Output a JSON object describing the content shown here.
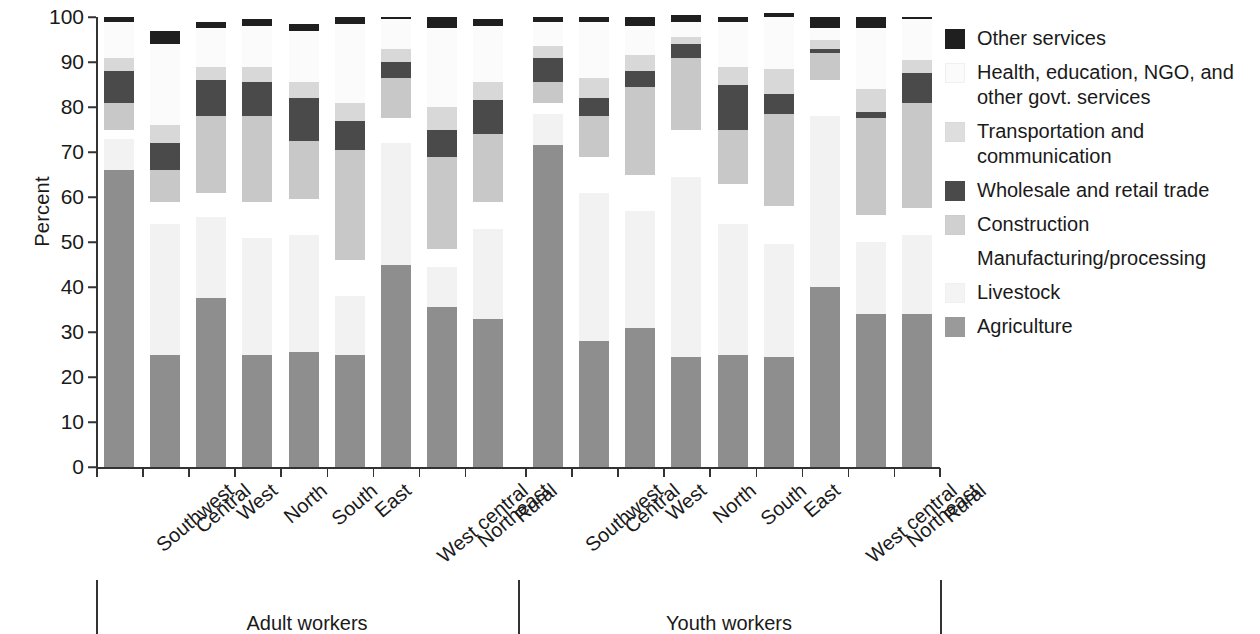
{
  "chart_data": {
    "type": "bar",
    "subtype": "stacked-bar",
    "title": "",
    "xlabel": "",
    "ylabel": "Percent",
    "ylim": [
      0,
      100
    ],
    "yticks": [
      0,
      10,
      20,
      30,
      40,
      50,
      60,
      70,
      80,
      90,
      100
    ],
    "grid": false,
    "legend_position": "right",
    "stack_order_bottom_to_top": [
      "Agriculture",
      "Livestock",
      "Manufacturing/processing",
      "Transportation and communication",
      "Wholesale and retail trade",
      "Construction",
      "Health, education, NGO, and other govt. services",
      "Other services"
    ],
    "groups": [
      {
        "name": "Adult workers",
        "categories": [
          "Southwest",
          "Central",
          "West",
          "North",
          "South",
          "East",
          "West central",
          "Northeast",
          "Rural"
        ]
      },
      {
        "name": "Youth workers",
        "categories": [
          "Southwest",
          "Central",
          "West",
          "North",
          "South",
          "East",
          "West central",
          "Northeast",
          "Rural"
        ]
      }
    ],
    "categories": [
      "Southwest",
      "Central",
      "West",
      "North",
      "South",
      "East",
      "West central",
      "Northeast",
      "Rural",
      "Southwest",
      "Central",
      "West",
      "North",
      "South",
      "East",
      "West central",
      "Northeast",
      "Rural"
    ],
    "series": [
      {
        "name": "Agriculture",
        "color": "#8e8e8e",
        "values": [
          66.0,
          25.0,
          37.5,
          25.0,
          25.5,
          25.0,
          45.0,
          35.5,
          33.0,
          71.5,
          28.0,
          31.0,
          24.5,
          25.0,
          24.5,
          40.0,
          34.0,
          34.0
        ]
      },
      {
        "name": "Livestock",
        "color": "#f2f2f2",
        "values": [
          7.0,
          29.0,
          18.0,
          26.0,
          26.0,
          13.0,
          27.0,
          9.0,
          20.0,
          7.0,
          33.0,
          26.0,
          40.0,
          29.0,
          25.0,
          38.0,
          16.0,
          17.5
        ]
      },
      {
        "name": "Manufacturing/processing",
        "color": "#ffffff",
        "values": [
          2.0,
          5.0,
          5.5,
          8.0,
          8.0,
          8.0,
          5.5,
          4.0,
          6.0,
          2.5,
          8.0,
          8.0,
          10.5,
          9.0,
          8.5,
          8.0,
          6.0,
          6.0
        ]
      },
      {
        "name": "Transportation and communication",
        "color": "#c8c8c8",
        "values": [
          6.0,
          7.0,
          17.0,
          19.0,
          13.0,
          24.5,
          9.0,
          20.5,
          15.0,
          4.5,
          9.0,
          19.5,
          16.0,
          12.0,
          20.5,
          6.0,
          21.5,
          23.5
        ]
      },
      {
        "name": "Wholesale and retail trade",
        "color": "#4a4a4a",
        "values": [
          7.0,
          6.0,
          8.0,
          7.5,
          9.5,
          6.5,
          3.5,
          6.0,
          7.5,
          5.5,
          4.0,
          3.5,
          3.0,
          10.0,
          4.5,
          1.0,
          1.5,
          6.5
        ]
      },
      {
        "name": "Construction",
        "color": "#d8d8d8",
        "values": [
          3.0,
          4.0,
          3.0,
          3.5,
          3.5,
          4.0,
          3.0,
          5.0,
          4.0,
          2.5,
          4.5,
          3.5,
          1.5,
          4.0,
          5.5,
          2.0,
          5.0,
          3.0
        ]
      },
      {
        "name": "Health, education, NGO, and other govt. services",
        "color": "#fbfbfb",
        "values": [
          8.0,
          18.0,
          8.5,
          9.0,
          11.5,
          17.5,
          6.5,
          17.5,
          12.5,
          5.5,
          12.5,
          6.5,
          3.5,
          10.0,
          11.5,
          2.5,
          13.5,
          9.0
        ]
      },
      {
        "name": "Other services",
        "color": "#1f1f1f",
        "values": [
          1.0,
          3.0,
          1.5,
          1.5,
          1.5,
          1.5,
          0.5,
          2.5,
          1.5,
          1.0,
          1.0,
          2.0,
          1.5,
          1.0,
          1.0,
          2.5,
          2.5,
          0.5
        ]
      }
    ]
  },
  "axis": {
    "y_title": "Percent",
    "y_ticks": [
      "0",
      "10",
      "20",
      "30",
      "40",
      "50",
      "60",
      "70",
      "80",
      "90",
      "100"
    ]
  },
  "x_labels": [
    "Southwest",
    "Central",
    "West",
    "North",
    "South",
    "East",
    "West central",
    "Northeast",
    "Rural",
    "Southwest",
    "Central",
    "West",
    "North",
    "South",
    "East",
    "West central",
    "Northeast",
    "Rural"
  ],
  "group_labels": [
    "Adult workers",
    "Youth workers"
  ],
  "legend": {
    "items": [
      {
        "label": "Other services",
        "color": "#1f1f1f",
        "border": "#1f1f1f"
      },
      {
        "label": "Health, education, NGO, and other govt. services",
        "color": "#fbfbfb",
        "border": "#f0f0f0"
      },
      {
        "label": "Transportation and communication",
        "color": "#dedede",
        "border": "#dadada"
      },
      {
        "label": "Wholesale and retail trade",
        "color": "#4a4a4a",
        "border": "#4a4a4a"
      },
      {
        "label": "Construction",
        "color": "#d0d0d0",
        "border": "#cccccc"
      },
      {
        "label": "Manufacturing/processing",
        "color": "#ffffff",
        "border": "#ffffff"
      },
      {
        "label": "Livestock",
        "color": "#f4f4f4",
        "border": "#f0f0f0"
      },
      {
        "label": "Agriculture",
        "color": "#9a9a9a",
        "border": "#9a9a9a"
      }
    ]
  }
}
